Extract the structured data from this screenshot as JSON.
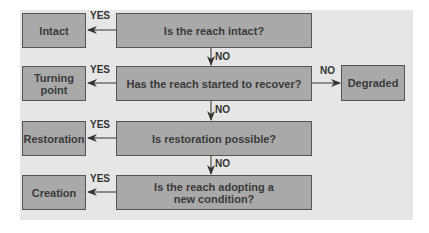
{
  "diagram": {
    "questions": [
      {
        "text": "Is the reach intact?"
      },
      {
        "text": "Has the reach started to recover?"
      },
      {
        "text": "Is restoration possible?"
      },
      {
        "text": "Is the reach adopting a new condition?"
      }
    ],
    "outcomes": [
      {
        "text": "Intact"
      },
      {
        "text": "Turning point"
      },
      {
        "text": "Restoration"
      },
      {
        "text": "Creation"
      }
    ],
    "side_outcome": {
      "text": "Degraded"
    },
    "labels": {
      "yes": "YES",
      "no": "NO"
    },
    "colors": {
      "panel": "#e6e6e6",
      "box_fill": "#a9a9a9",
      "box_border": "#555555",
      "text": "#3a3a3a"
    }
  }
}
